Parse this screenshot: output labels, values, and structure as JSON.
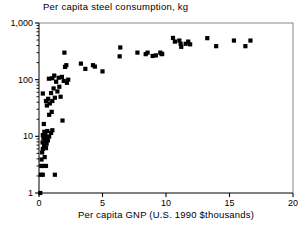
{
  "chart_data": {
    "type": "scatter",
    "title": "Per capita steel consumption, kg",
    "xlabel": "Per capita GNP (U.S. 1990 $thousands)",
    "ylabel": "",
    "xscale": "linear",
    "yscale": "log",
    "xlim": [
      0,
      20
    ],
    "ylim": [
      1,
      1000
    ],
    "grid": false,
    "legend": null,
    "xticks": [
      0,
      5,
      10,
      15,
      20
    ],
    "xtick_labels": [
      "0",
      "5",
      "10",
      "15",
      "20"
    ],
    "yticks": [
      1,
      10,
      100,
      1000
    ],
    "ytick_labels": [
      "1",
      "10",
      "100",
      "1,000"
    ],
    "marker": "square",
    "marker_color": "#000000",
    "points": [
      [
        0.1,
        1.0
      ],
      [
        0.15,
        2.1
      ],
      [
        0.3,
        2.1
      ],
      [
        1.25,
        2.1
      ],
      [
        0.18,
        3.0
      ],
      [
        0.35,
        3.0
      ],
      [
        0.55,
        3.0
      ],
      [
        0.2,
        3.9
      ],
      [
        0.45,
        4.3
      ],
      [
        0.25,
        5.2
      ],
      [
        0.3,
        6.0
      ],
      [
        0.55,
        6.2
      ],
      [
        0.4,
        6.8
      ],
      [
        0.6,
        7.4
      ],
      [
        0.28,
        7.8
      ],
      [
        0.48,
        8.2
      ],
      [
        0.7,
        8.5
      ],
      [
        0.35,
        9.2
      ],
      [
        0.58,
        9.6
      ],
      [
        0.8,
        9.9
      ],
      [
        0.3,
        10.5
      ],
      [
        0.5,
        11.0
      ],
      [
        0.95,
        11.5
      ],
      [
        0.42,
        12.0
      ],
      [
        0.65,
        12.4
      ],
      [
        1.05,
        12.8
      ],
      [
        0.38,
        16.5
      ],
      [
        1.85,
        19.0
      ],
      [
        0.8,
        24.0
      ],
      [
        1.0,
        27.0
      ],
      [
        0.62,
        35.0
      ],
      [
        0.85,
        38.0
      ],
      [
        0.55,
        42.0
      ],
      [
        1.05,
        42.0
      ],
      [
        0.72,
        46.0
      ],
      [
        1.25,
        48.0
      ],
      [
        1.7,
        50.0
      ],
      [
        0.3,
        57.0
      ],
      [
        0.95,
        58.0
      ],
      [
        1.45,
        62.0
      ],
      [
        1.15,
        70.0
      ],
      [
        1.6,
        75.0
      ],
      [
        2.2,
        88.0
      ],
      [
        1.35,
        92.0
      ],
      [
        1.95,
        95.0
      ],
      [
        2.3,
        100.0
      ],
      [
        0.78,
        104.0
      ],
      [
        1.05,
        106.0
      ],
      [
        1.55,
        108.0
      ],
      [
        1.8,
        112.0
      ],
      [
        1.2,
        118.0
      ],
      [
        2.05,
        168.0
      ],
      [
        2.15,
        180.0
      ],
      [
        3.3,
        192.0
      ],
      [
        3.65,
        155.0
      ],
      [
        4.25,
        180.0
      ],
      [
        4.4,
        170.0
      ],
      [
        5.0,
        140.0
      ],
      [
        2.0,
        300.0
      ],
      [
        6.35,
        258.0
      ],
      [
        6.4,
        370.0
      ],
      [
        7.75,
        300.0
      ],
      [
        8.4,
        282.0
      ],
      [
        8.55,
        300.0
      ],
      [
        8.95,
        262.0
      ],
      [
        9.2,
        268.0
      ],
      [
        9.55,
        300.0
      ],
      [
        9.65,
        282.0
      ],
      [
        9.7,
        285.0
      ],
      [
        10.55,
        545.0
      ],
      [
        10.7,
        470.0
      ],
      [
        11.05,
        490.0
      ],
      [
        11.15,
        430.0
      ],
      [
        11.2,
        380.0
      ],
      [
        11.55,
        430.0
      ],
      [
        11.75,
        470.0
      ],
      [
        11.9,
        420.0
      ],
      [
        13.25,
        540.0
      ],
      [
        13.95,
        390.0
      ],
      [
        15.35,
        490.0
      ],
      [
        16.25,
        390.0
      ],
      [
        16.65,
        490.0
      ]
    ]
  }
}
